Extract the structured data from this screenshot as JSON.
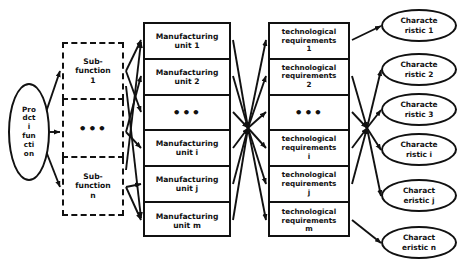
{
  "diagram": {
    "stroke_color": "#111111",
    "background_color": "#ffffff",
    "source": {
      "lines": [
        "Pro",
        "dct",
        "i",
        "fun",
        "cti",
        "on"
      ]
    },
    "subfunctions": [
      {
        "lines": [
          "Sub-",
          "function",
          "1"
        ]
      },
      {
        "lines": [
          "•••"
        ]
      },
      {
        "lines": [
          "Sub-",
          "function",
          "n"
        ]
      }
    ],
    "manufacturing_units": [
      {
        "lines": [
          "Manufacturing",
          "unit 1"
        ]
      },
      {
        "lines": [
          "Manufacturing",
          "unit 2"
        ]
      },
      {
        "lines": [
          "•••"
        ]
      },
      {
        "lines": [
          "Manufacturing",
          "unit i"
        ]
      },
      {
        "lines": [
          "Manufacturing",
          "unit j"
        ]
      },
      {
        "lines": [
          "Manufacturing",
          "unit m"
        ]
      }
    ],
    "technological_requirements": [
      {
        "lines": [
          "technological",
          "requirements",
          "1"
        ]
      },
      {
        "lines": [
          "technological",
          "requirements",
          "2"
        ]
      },
      {
        "lines": [
          "•••"
        ]
      },
      {
        "lines": [
          "technological",
          "requirements",
          "i"
        ]
      },
      {
        "lines": [
          "technological",
          "requirements",
          "j"
        ]
      },
      {
        "lines": [
          "technological",
          "requirements",
          "m"
        ]
      }
    ],
    "characteristics": [
      {
        "lines": [
          "Characte",
          "ristic 1"
        ]
      },
      {
        "lines": [
          "Characte",
          "ristic 2"
        ]
      },
      {
        "lines": [
          "Characte",
          "ristic 3"
        ]
      },
      {
        "lines": [
          "Characte",
          "ristic i"
        ]
      },
      {
        "lines": [
          "Charact",
          "eristic j"
        ]
      },
      {
        "lines": [
          "Charact",
          "eristic n"
        ]
      }
    ]
  }
}
